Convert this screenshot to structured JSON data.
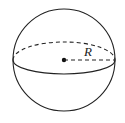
{
  "diagram": {
    "radius_label": "R",
    "stroke_color": "#222222",
    "background": "#ffffff"
  }
}
